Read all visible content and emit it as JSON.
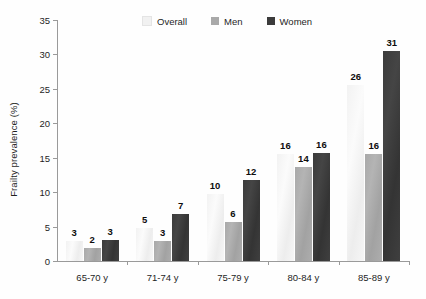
{
  "chart_data": {
    "type": "bar",
    "title": "",
    "xlabel": "",
    "ylabel": "Frailty prevalence (%)",
    "ylim": [
      0,
      35
    ],
    "yticks": [
      0,
      5,
      10,
      15,
      20,
      25,
      30,
      35
    ],
    "grid": false,
    "legend_position": "top-center",
    "categories": [
      "65-70 y",
      "71-74 y",
      "75-79 y",
      "80-84 y",
      "85-89 y"
    ],
    "series": [
      {
        "name": "Overall",
        "color": "#f4f4f4",
        "values": [
          3,
          5,
          10,
          16,
          26
        ],
        "plotted": [
          2.9,
          4.8,
          9.8,
          15.6,
          25.6
        ],
        "labels": [
          "3",
          "5",
          "10",
          "16",
          "26"
        ]
      },
      {
        "name": "Men",
        "color": "#a9a9a9",
        "values": [
          2,
          3,
          6,
          14,
          16
        ],
        "plotted": [
          1.9,
          2.9,
          5.7,
          13.7,
          15.5
        ],
        "labels": [
          "2",
          "3",
          "6",
          "14",
          "16"
        ]
      },
      {
        "name": "Women",
        "color": "#3b3b3b",
        "values": [
          3,
          7,
          12,
          16,
          31
        ],
        "plotted": [
          3.0,
          6.8,
          11.8,
          15.7,
          30.5
        ],
        "labels": [
          "3",
          "7",
          "12",
          "16",
          "31"
        ]
      }
    ]
  },
  "axes": {
    "y_title": "Frailty prevalence (%)",
    "y_tick_labels": [
      "0",
      "5",
      "10",
      "15",
      "20",
      "25",
      "30",
      "35"
    ],
    "x_tick_labels": [
      "65-70 y",
      "71-74 y",
      "75-79 y",
      "80-84 y",
      "85-89 y"
    ]
  },
  "legend": {
    "items": [
      {
        "label": "Overall",
        "swatch": "#f1f1f1"
      },
      {
        "label": "Men",
        "swatch": "#a9a9a9"
      },
      {
        "label": "Women",
        "swatch": "#3b3b3b"
      }
    ]
  },
  "colors": {
    "axis": "#9a9a9a",
    "text": "#1f1f1f",
    "value_label": "#0d0d0d",
    "background": "#ffffff"
  }
}
